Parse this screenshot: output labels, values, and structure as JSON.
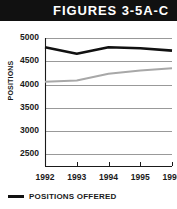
{
  "banner": {
    "title": "FIGURES 3-5A-C"
  },
  "legend": {
    "entries": [
      {
        "label": "POSITIONS OFFERED",
        "color": "#111111"
      }
    ]
  },
  "chart_data": {
    "type": "line",
    "title": "FIGURES 3-5A-C",
    "xlabel": "",
    "ylabel": "POSITIONS",
    "categories": [
      "1992",
      "1993",
      "1994",
      "1995",
      "1996"
    ],
    "x": [
      1992,
      1993,
      1994,
      1995,
      1996
    ],
    "ylim": [
      2250,
      5000
    ],
    "yticks": [
      5000,
      4500,
      4000,
      3500,
      3000,
      2500
    ],
    "ytick_labels": [
      "5000",
      "4500",
      "4000",
      "3500",
      "3000",
      "2500"
    ],
    "grid": true,
    "legend_position": "below-left",
    "series": [
      {
        "name": "POSITIONS OFFERED",
        "color": "#111111",
        "width": 2.6,
        "values": [
          4800,
          4660,
          4800,
          4780,
          4730
        ]
      },
      {
        "name": "",
        "color": "#a8a8a8",
        "width": 2.0,
        "values": [
          4060,
          4090,
          4230,
          4300,
          4350
        ]
      }
    ]
  },
  "axis": {
    "y_title": "POSITIONS"
  }
}
